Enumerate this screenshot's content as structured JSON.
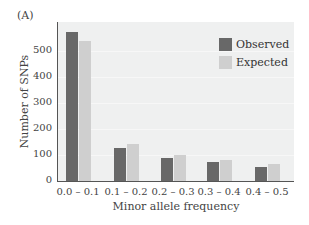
{
  "panel_label": "(A)",
  "chart_data": {
    "type": "bar",
    "title": "",
    "xlabel": "Minor allele frequency",
    "ylabel": "Number of SNPs",
    "ylim": [
      0,
      600
    ],
    "yticks": [
      0,
      100,
      200,
      300,
      400,
      500
    ],
    "categories": [
      "0.0 – 0.1",
      "0.1 – 0.2",
      "0.2 – 0.3",
      "0.3 – 0.4",
      "0.4 – 0.5"
    ],
    "series": [
      {
        "name": "Observed",
        "color": "#686868",
        "values": [
          573,
          127,
          90,
          73,
          55
        ]
      },
      {
        "name": "Expected",
        "color": "#cfcfcf",
        "values": [
          538,
          142,
          100,
          80,
          65
        ]
      }
    ],
    "grid": false,
    "legend_position": "upper right"
  },
  "legend": {
    "items": [
      {
        "label": "Observed",
        "color": "#686868"
      },
      {
        "label": "Expected",
        "color": "#cfcfcf"
      }
    ]
  }
}
